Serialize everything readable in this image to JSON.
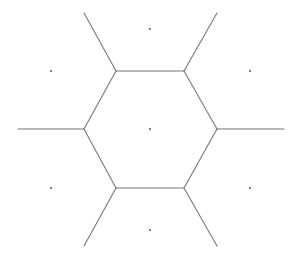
{
  "diagram": {
    "type": "voronoi",
    "width": 296,
    "height": 257,
    "background": "#ffffff",
    "edge_color": "#777777",
    "site_color": "#555555",
    "site_radius": 1,
    "cell_vertices": [
      {
        "x": 116,
        "y": 71
      },
      {
        "x": 184,
        "y": 71
      },
      {
        "x": 217,
        "y": 129
      },
      {
        "x": 184,
        "y": 188
      },
      {
        "x": 116,
        "y": 188
      },
      {
        "x": 84,
        "y": 129
      }
    ],
    "edges": [
      {
        "x1": 116,
        "y1": 71,
        "x2": 184,
        "y2": 71
      },
      {
        "x1": 184,
        "y1": 71,
        "x2": 217,
        "y2": 129
      },
      {
        "x1": 217,
        "y1": 129,
        "x2": 184,
        "y2": 188
      },
      {
        "x1": 184,
        "y1": 188,
        "x2": 116,
        "y2": 188
      },
      {
        "x1": 116,
        "y1": 188,
        "x2": 84,
        "y2": 129
      },
      {
        "x1": 84,
        "y1": 129,
        "x2": 116,
        "y2": 71
      },
      {
        "x1": 116,
        "y1": 71,
        "x2": 84,
        "y2": 13
      },
      {
        "x1": 184,
        "y1": 71,
        "x2": 217,
        "y2": 13
      },
      {
        "x1": 84,
        "y1": 129,
        "x2": 18,
        "y2": 129
      },
      {
        "x1": 217,
        "y1": 129,
        "x2": 284,
        "y2": 129
      },
      {
        "x1": 116,
        "y1": 188,
        "x2": 84,
        "y2": 246
      },
      {
        "x1": 184,
        "y1": 188,
        "x2": 217,
        "y2": 246
      }
    ],
    "sites": [
      {
        "name": "top",
        "x": 150,
        "y": 29
      },
      {
        "name": "top-left",
        "x": 51,
        "y": 71
      },
      {
        "name": "top-right",
        "x": 250,
        "y": 71
      },
      {
        "name": "center",
        "x": 150,
        "y": 129
      },
      {
        "name": "bottom-left",
        "x": 51,
        "y": 188
      },
      {
        "name": "bottom-right",
        "x": 250,
        "y": 188
      },
      {
        "name": "bottom",
        "x": 150,
        "y": 230
      }
    ]
  }
}
